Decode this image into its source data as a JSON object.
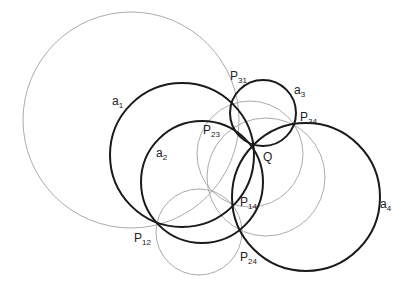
{
  "diagram": {
    "type": "circle-configuration",
    "stroke_colors": {
      "thick": "#1a1a1a",
      "thin": "#a0a0a0"
    },
    "thick_circles": [
      {
        "id": "a1",
        "cx": 182,
        "cy": 155,
        "r": 72
      },
      {
        "id": "a2",
        "cx": 202,
        "cy": 182,
        "r": 61
      },
      {
        "id": "a3",
        "cx": 263,
        "cy": 113,
        "r": 33
      },
      {
        "id": "a4",
        "cx": 306,
        "cy": 197,
        "r": 74
      }
    ],
    "thin_circles": [
      {
        "id": "t1",
        "cx": 131,
        "cy": 120,
        "r": 108
      },
      {
        "id": "t2",
        "cx": 250,
        "cy": 154,
        "r": 53
      },
      {
        "id": "t3",
        "cx": 266,
        "cy": 177,
        "r": 59
      },
      {
        "id": "t4",
        "cx": 199,
        "cy": 232,
        "r": 43
      }
    ],
    "labels": [
      {
        "id": "a1",
        "base": "a",
        "sub": "1",
        "x": 112,
        "y": 95
      },
      {
        "id": "a2",
        "base": "a",
        "sub": "2",
        "x": 156,
        "y": 147
      },
      {
        "id": "a3",
        "base": "a",
        "sub": "3",
        "x": 294,
        "y": 84
      },
      {
        "id": "a4",
        "base": "a",
        "sub": "4",
        "x": 380,
        "y": 198
      },
      {
        "id": "P31",
        "base": "P",
        "sub": "31",
        "x": 230,
        "y": 70
      },
      {
        "id": "P34",
        "base": "P",
        "sub": "34",
        "x": 300,
        "y": 111
      },
      {
        "id": "P23",
        "base": "P",
        "sub": "23",
        "x": 203,
        "y": 124
      },
      {
        "id": "Q",
        "base": "Q",
        "sub": "",
        "x": 263,
        "y": 151
      },
      {
        "id": "P14",
        "base": "P",
        "sub": "14",
        "x": 240,
        "y": 196
      },
      {
        "id": "P12",
        "base": "P",
        "sub": "12",
        "x": 134,
        "y": 232
      },
      {
        "id": "P24",
        "base": "P",
        "sub": "24",
        "x": 240,
        "y": 251
      }
    ]
  }
}
